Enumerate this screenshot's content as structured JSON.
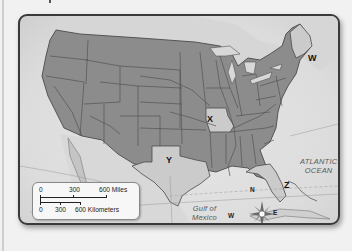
{
  "map": {
    "subject": "United States",
    "labels": {
      "w": "W",
      "x": "X",
      "y": "Y",
      "z": "Z"
    },
    "water_bodies": {
      "atlantic_line1": "ATLANTIC",
      "atlantic_line2": "OCEAN",
      "gulf_line1": "Gulf of",
      "gulf_line2": "Mexico"
    },
    "compass": {
      "n": "N",
      "s": "S",
      "e": "E",
      "w": "W"
    },
    "scale": {
      "miles": [
        "0",
        "300",
        "600 Miles"
      ],
      "kilometers": [
        "0",
        "300",
        "600 Kilometers"
      ]
    },
    "colors": {
      "land": "#8c8c8c",
      "highlighted_state": "#c9c9c9",
      "border": "#4a4a4a",
      "water": "#e2e2e2",
      "foreign_land": "#d4d4d4"
    }
  }
}
